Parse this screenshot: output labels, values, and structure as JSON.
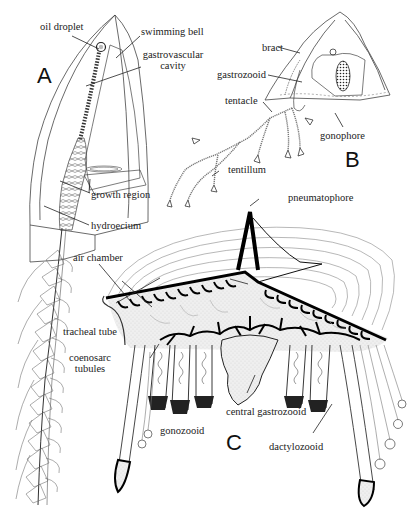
{
  "figure": {
    "panels": {
      "A": {
        "letter": "A",
        "labels": {
          "oil_droplet": "oil droplet",
          "swimming_bell": "swimming bell",
          "gastrovascular_cavity_1": "gastrovascular",
          "gastrovascular_cavity_2": "cavity",
          "growth_region": "growth region",
          "hydroecium": "hydroecium"
        }
      },
      "B": {
        "letter": "B",
        "labels": {
          "bract": "bract",
          "gastrozooid": "gastrozooid",
          "tentacle": "tentacle",
          "gonophore": "gonophore",
          "tentillum": "tentillum"
        }
      },
      "C": {
        "letter": "C",
        "labels": {
          "pneumatophore": "pneumatophore",
          "air_chamber": "air chamber",
          "tracheal_tube": "tracheal tube",
          "coenosarc_tubules_1": "coenosarc",
          "coenosarc_tubules_2": "tubules",
          "central_gastrozooid": "central gastrozooid",
          "gonozooid": "gonozooid",
          "dactylozooid": "dactylozooid"
        }
      }
    },
    "colors": {
      "ink": "#1a1a1a",
      "fine_line": "#555555",
      "stipple": "#e6e6e6",
      "background": "#ffffff"
    }
  }
}
